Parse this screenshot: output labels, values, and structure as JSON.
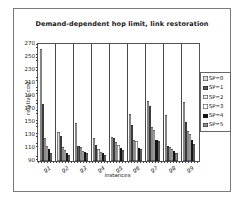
{
  "figure": {
    "background": "#ffffff",
    "frame_border_color": "#7a7a7a"
  },
  "chart_data": {
    "type": "bar",
    "title": "Demand-dependent hop limit, link restoration",
    "xlabel": "instances",
    "ylabel": "relative cost",
    "ylim": [
      90,
      270
    ],
    "yticks": [
      90,
      110,
      130,
      150,
      170,
      190,
      210,
      230,
      250,
      270
    ],
    "grid": "vertical category separators",
    "legend_position": "right",
    "categories": [
      "g1",
      "g2",
      "g3",
      "g4",
      "g5",
      "g6",
      "g7",
      "g8",
      "g9"
    ],
    "series": [
      {
        "name": "SP=0",
        "pattern": "speckled",
        "color": "#dcdcdc",
        "values": [
          263,
          135,
          149,
          125,
          127,
          163,
          182,
          161,
          181
        ]
      },
      {
        "name": "SP=1",
        "pattern": "solid",
        "color": "#5a5a5a",
        "values": [
          178,
          128,
          113,
          114,
          126,
          145,
          175,
          113,
          150
        ]
      },
      {
        "name": "SP=2",
        "pattern": "solid",
        "color": "#ececec",
        "values": [
          125,
          112,
          111,
          109,
          120,
          122,
          142,
          112,
          136
        ]
      },
      {
        "name": "SP=3",
        "pattern": "solid",
        "color": "#ffffff",
        "values": [
          113,
          107,
          106,
          104,
          114,
          121,
          137,
          109,
          131
        ]
      },
      {
        "name": "SP=4",
        "pattern": "solid",
        "color": "#141414",
        "values": [
          108,
          102,
          104,
          102,
          110,
          110,
          123,
          105,
          122
        ]
      },
      {
        "name": "SP=5",
        "pattern": "solid",
        "color": "#8f8f8f",
        "values": [
          102,
          99,
          102,
          100,
          107,
          108,
          121,
          103,
          116
        ]
      }
    ]
  }
}
